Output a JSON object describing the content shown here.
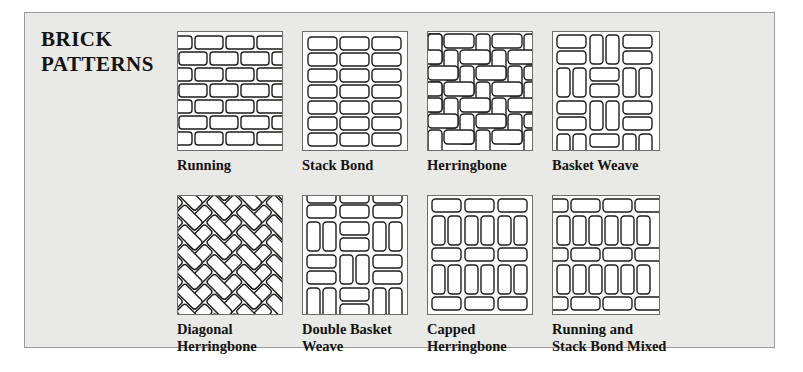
{
  "figure": {
    "title_lines": [
      "BRICK",
      "PATTERNS"
    ],
    "background_color": "#e9e9e7",
    "panel_border_color": "#9b9b99",
    "swatch_background": "#ffffff",
    "brick_outline_color": "#1d1d1b"
  },
  "patterns": [
    {
      "id": "running",
      "label_lines": [
        "Running"
      ],
      "label": "Running",
      "description": "Offset horizontal courses, each row shifted half a brick",
      "row": 1,
      "column": 1,
      "layout": {
        "type": "running-bond",
        "courses": 7,
        "bricks_per_course": 3.5
      }
    },
    {
      "id": "stack-bond",
      "label_lines": [
        "Stack Bond"
      ],
      "label": "Stack Bond",
      "description": "Aligned grid of bricks, no offset",
      "row": 1,
      "column": 2,
      "layout": {
        "type": "stack-bond",
        "rows": 7,
        "columns": 3
      }
    },
    {
      "id": "herringbone",
      "label_lines": [
        "Herringbone"
      ],
      "label": "Herringbone",
      "description": "Interlocking bricks set at right angles",
      "row": 1,
      "column": 3,
      "layout": {
        "type": "herringbone",
        "angle_degrees": 90
      }
    },
    {
      "id": "basket-weave",
      "label_lines": [
        "Basket Weave"
      ],
      "label": "Basket Weave",
      "description": "Alternating pairs of horizontal and vertical bricks",
      "row": 1,
      "column": 4,
      "layout": {
        "type": "basket-weave",
        "bricks_per_block": 2,
        "blocks_across": 3
      }
    },
    {
      "id": "diagonal-herringbone",
      "label_lines": [
        "Diagonal",
        "Herringbone"
      ],
      "label": "Diagonal Herringbone",
      "description": "Herringbone rotated forty-five degrees",
      "row": 2,
      "column": 1,
      "layout": {
        "type": "herringbone",
        "angle_degrees": 45
      }
    },
    {
      "id": "double-basket-weave",
      "label_lines": [
        "Double Basket",
        "Weave"
      ],
      "label": "Double Basket Weave",
      "description": "Basket weave with paired bricks in each block",
      "row": 2,
      "column": 2,
      "layout": {
        "type": "basket-weave",
        "bricks_per_block": 2,
        "blocks_across": 3,
        "double": true
      }
    },
    {
      "id": "capped-herringbone",
      "label_lines": [
        "Capped",
        "Herringbone"
      ],
      "label": "Capped Herringbone",
      "description": "Bands of vertical bricks capped by horizontal courses",
      "row": 2,
      "column": 3,
      "layout": {
        "type": "capped",
        "cap_rows": 3,
        "field_rows": 2
      }
    },
    {
      "id": "running-and-stack-bond-mixed",
      "label_lines": [
        "Running and",
        "Stack Bond Mixed"
      ],
      "label": "Running and Stack Bond Mixed",
      "description": "Running bond courses alternating with stacked vertical courses",
      "row": 2,
      "column": 4,
      "layout": {
        "type": "mixed",
        "running_rows": 3,
        "stack_rows": 2
      }
    }
  ]
}
